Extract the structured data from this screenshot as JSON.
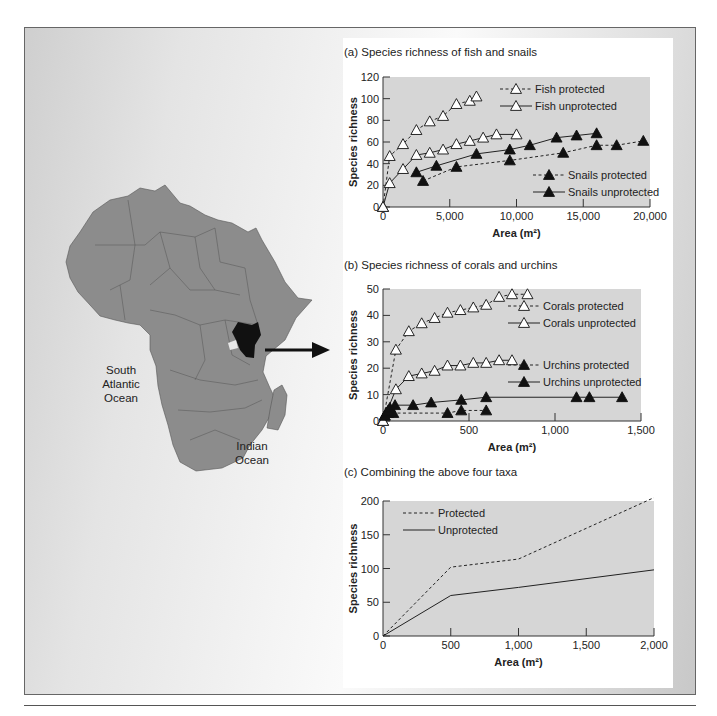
{
  "map": {
    "labels": {
      "atlantic": [
        "South",
        "Atlantic",
        "Ocean"
      ],
      "indian": [
        "Indian",
        "Ocean"
      ]
    },
    "highlighted_country": "Kenya",
    "colors": {
      "land": "#8c8c8c",
      "highlight": "#111111",
      "border": "#555555"
    }
  },
  "chart_data": [
    {
      "id": "a",
      "type": "line",
      "title": "(a) Species richness of fish and snails",
      "xlabel": "Area (m²)",
      "ylabel": "Species richness",
      "xlim": [
        0,
        20000
      ],
      "ylim": [
        0,
        120
      ],
      "xticks": [
        "0",
        "5,000",
        "10,000",
        "15,000",
        "20,000"
      ],
      "yticks": [
        "0",
        "20",
        "40",
        "60",
        "80",
        "100",
        "120"
      ],
      "series": [
        {
          "name": "Fish protected",
          "marker": "open-triangle",
          "line": "dashed",
          "x": [
            0,
            500,
            1500,
            2500,
            3500,
            4500,
            5500,
            6500,
            7000
          ],
          "y": [
            0,
            47,
            58,
            71,
            79,
            84,
            95,
            98,
            102
          ]
        },
        {
          "name": "Fish unprotected",
          "marker": "open-triangle",
          "line": "solid",
          "x": [
            0,
            500,
            1500,
            2500,
            3500,
            4500,
            5500,
            6500,
            7500,
            8500,
            10000
          ],
          "y": [
            0,
            22,
            35,
            48,
            50,
            53,
            58,
            61,
            64,
            67,
            67
          ]
        },
        {
          "name": "Snails protected",
          "marker": "filled-triangle",
          "line": "dashed",
          "x": [
            3000,
            5500,
            9500,
            13500,
            16000,
            17500,
            19500
          ],
          "y": [
            24,
            37,
            43,
            50,
            57,
            57,
            61
          ]
        },
        {
          "name": "Snails unprotected",
          "marker": "filled-triangle",
          "line": "solid",
          "x": [
            2500,
            4000,
            7000,
            9500,
            11000,
            13000,
            14500,
            16000
          ],
          "y": [
            32,
            38,
            49,
            53,
            57,
            64,
            66,
            68
          ]
        }
      ],
      "legend_position": "inside"
    },
    {
      "id": "b",
      "type": "line",
      "title": "(b) Species richness of corals and urchins",
      "xlabel": "Area (m²)",
      "ylabel": "Species richness",
      "xlim": [
        0,
        1500
      ],
      "ylim": [
        0,
        50
      ],
      "xticks": [
        "0",
        "500",
        "1,000",
        "1,500"
      ],
      "yticks": [
        "0",
        "10",
        "20",
        "30",
        "40",
        "50"
      ],
      "series": [
        {
          "name": "Corals protected",
          "marker": "open-triangle",
          "line": "dashed",
          "x": [
            0,
            75,
            150,
            225,
            300,
            375,
            450,
            525,
            600,
            675,
            750,
            840
          ],
          "y": [
            0,
            27,
            34,
            37,
            39,
            41,
            42,
            43,
            44,
            47,
            48,
            48
          ]
        },
        {
          "name": "Corals unprotected",
          "marker": "open-triangle",
          "line": "solid",
          "x": [
            0,
            75,
            150,
            225,
            300,
            375,
            450,
            525,
            600,
            675,
            750
          ],
          "y": [
            0,
            12,
            17,
            18,
            19,
            21,
            21,
            22,
            22,
            23,
            23
          ]
        },
        {
          "name": "Urchins protected",
          "marker": "filled-triangle",
          "line": "dashed",
          "x": [
            10,
            20,
            30,
            40,
            60,
            375,
            455,
            600
          ],
          "y": [
            2,
            3,
            3,
            4,
            3,
            3,
            4,
            4
          ]
        },
        {
          "name": "Urchins unprotected",
          "marker": "filled-triangle",
          "line": "solid",
          "x": [
            10,
            20,
            30,
            40,
            70,
            175,
            280,
            455,
            600,
            1125,
            1200,
            1390
          ],
          "y": [
            2,
            3,
            4,
            5,
            6,
            6,
            7,
            8,
            9,
            9,
            9,
            9
          ]
        }
      ],
      "legend_position": "inside"
    },
    {
      "id": "c",
      "type": "line",
      "title": "(c) Combining the above four taxa",
      "xlabel": "Area (m²)",
      "ylabel": "Species richness",
      "xlim": [
        0,
        2000
      ],
      "ylim": [
        0,
        200
      ],
      "xticks": [
        "0",
        "500",
        "1,000",
        "1,500",
        "2,000"
      ],
      "yticks": [
        "0",
        "50",
        "100",
        "150",
        "200"
      ],
      "series": [
        {
          "name": "Protected",
          "line": "dashed",
          "x": [
            0,
            500,
            1000,
            2000
          ],
          "y": [
            0,
            102,
            114,
            205
          ]
        },
        {
          "name": "Unprotected",
          "line": "solid",
          "x": [
            0,
            500,
            1000,
            2000
          ],
          "y": [
            0,
            60,
            72,
            98
          ]
        }
      ],
      "legend_position": "upper-left"
    }
  ]
}
